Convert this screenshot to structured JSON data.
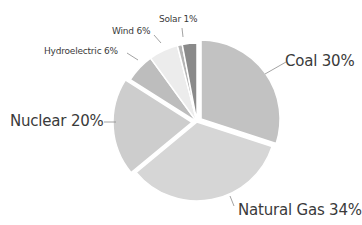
{
  "chart_data": {
    "type": "pie",
    "title": "",
    "categories": [
      "Coal",
      "Natural Gas",
      "Nuclear",
      "Hydroelectric",
      "Wind",
      "Solar",
      "Other"
    ],
    "values": [
      30,
      34,
      20,
      6,
      6,
      1,
      3
    ],
    "labels": [
      "Coal 30%",
      "Natural Gas 34%",
      "Nuclear 20%",
      "Hydroelectric 6%",
      "Wind 6%",
      "Solar 1%",
      ""
    ],
    "colors": [
      "#c2c2c2",
      "#d6d6d6",
      "#cdcdcd",
      "#bdbdbd",
      "#ececec",
      "#b5b5b5",
      "#8a8a8a"
    ],
    "exploded": [
      "Coal",
      "Nuclear"
    ],
    "start_angle_deg": 0,
    "direction": "clockwise"
  },
  "labels": {
    "coal": "Coal 30%",
    "natural_gas": "Natural Gas 34%",
    "nuclear": "Nuclear 20%",
    "hydro": "Hydroelectric 6%",
    "wind": "Wind 6%",
    "solar": "Solar 1%"
  }
}
